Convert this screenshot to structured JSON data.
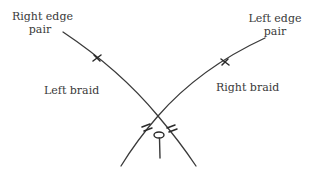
{
  "diagram": {
    "type": "braid-crossing-illustration",
    "labels": {
      "right_edge_pair_line1": "Right edge",
      "right_edge_pair_line2": "pair",
      "left_edge_pair_line1": "Left edge",
      "left_edge_pair_line2": "pair",
      "left_braid": "Left braid",
      "right_braid": "Right braid"
    },
    "elements": [
      {
        "id": "left-braid-strand",
        "description": "Strand from top-left (right edge pair) curving down to bottom-right, with one single tick and one double tick"
      },
      {
        "id": "right-braid-strand",
        "description": "Strand from top-right (left edge pair) curving down to bottom-left, with one single tick and one double tick"
      },
      {
        "id": "crossing",
        "description": "The two strands cross above a pin"
      },
      {
        "id": "pin",
        "description": "Pin below the crossing"
      }
    ],
    "colors": {
      "line": "#3a3a3a",
      "text": "#3a3a3a",
      "background": "#ffffff"
    }
  }
}
